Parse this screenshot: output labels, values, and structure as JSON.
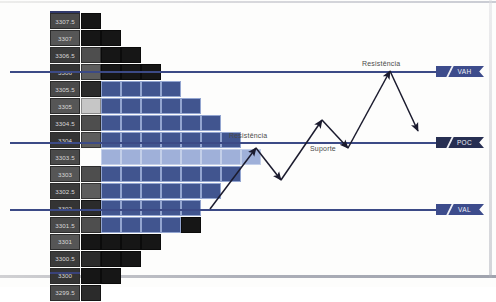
{
  "chart_data": {
    "type": "bar",
    "orientation": "horizontal",
    "title": "",
    "xlabel": "",
    "ylabel": "Preço",
    "grid": false,
    "legend": "right-tags",
    "categories": [
      "3307.5",
      "3307",
      "3306.5",
      "3306",
      "3305.5",
      "3305",
      "3304.5",
      "3304",
      "3303.5",
      "3303",
      "3302.5",
      "3302",
      "3301.5",
      "3301",
      "3300.5",
      "3300",
      "3299.5"
    ],
    "values": [
      1,
      2,
      3,
      4,
      5,
      6,
      7,
      8,
      9,
      8,
      7,
      6,
      5,
      4,
      3,
      2,
      1
    ],
    "rows": [
      {
        "price": "3307.5",
        "count": 1,
        "cells": [
          "c-black"
        ]
      },
      {
        "price": "3307",
        "count": 2,
        "cells": [
          "c-black",
          "c-black"
        ]
      },
      {
        "price": "3306.5",
        "count": 3,
        "cells": [
          "c-gray",
          "c-black",
          "c-black"
        ]
      },
      {
        "price": "3306",
        "count": 4,
        "cells": [
          "c-mgray",
          "c-black",
          "c-black",
          "c-black"
        ]
      },
      {
        "price": "3305.5",
        "count": 5,
        "cells": [
          "c-dkgray",
          "c-blue",
          "c-blue",
          "c-blue",
          "c-blue"
        ]
      },
      {
        "price": "3305",
        "count": 6,
        "cells": [
          "c-xlgray",
          "c-blue",
          "c-blue",
          "c-blue",
          "c-blue",
          "c-blue"
        ]
      },
      {
        "price": "3304.5",
        "count": 7,
        "cells": [
          "c-gray",
          "c-blue",
          "c-blue",
          "c-blue",
          "c-blue",
          "c-blue",
          "c-blue"
        ]
      },
      {
        "price": "3304",
        "count": 8,
        "cells": [
          "c-mgray",
          "c-blue",
          "c-blue",
          "c-blue",
          "c-blue",
          "c-blue",
          "c-blue",
          "c-blue"
        ]
      },
      {
        "price": "3303.5",
        "count": 9,
        "cells": [
          "c-blank",
          "c-lblue",
          "c-lblue",
          "c-lblue",
          "c-lblue",
          "c-lblue",
          "c-lblue",
          "c-lblue",
          "c-lblue"
        ]
      },
      {
        "price": "3303",
        "count": 8,
        "cells": [
          "c-gray",
          "c-blue",
          "c-blue",
          "c-blue",
          "c-blue",
          "c-blue",
          "c-blue",
          "c-blue"
        ]
      },
      {
        "price": "3302.5",
        "count": 7,
        "cells": [
          "c-mgray",
          "c-blue",
          "c-blue",
          "c-blue",
          "c-blue",
          "c-blue",
          "c-blue"
        ]
      },
      {
        "price": "3302",
        "count": 6,
        "cells": [
          "c-dkgray",
          "c-blue",
          "c-blue",
          "c-blue",
          "c-blue",
          "c-blue"
        ]
      },
      {
        "price": "3301.5",
        "count": 6,
        "cells": [
          "c-gray",
          "c-blue",
          "c-blue",
          "c-blue",
          "c-blue",
          "c-black"
        ]
      },
      {
        "price": "3301",
        "count": 4,
        "cells": [
          "c-black",
          "c-black",
          "c-black",
          "c-black"
        ]
      },
      {
        "price": "3300.5",
        "count": 3,
        "cells": [
          "c-dkgray",
          "c-black",
          "c-black"
        ]
      },
      {
        "price": "3300",
        "count": 2,
        "cells": [
          "c-black",
          "c-black"
        ]
      },
      {
        "price": "3299.5",
        "count": 1,
        "cells": [
          "c-dkgray"
        ]
      }
    ],
    "levels": [
      {
        "key": "vah",
        "label": "VAH",
        "price": "3306",
        "y": 71
      },
      {
        "key": "poc",
        "label": "POC",
        "price": "3303.5",
        "y": 142
      },
      {
        "key": "val",
        "label": "VAL",
        "price": "3301.5",
        "y": 209
      }
    ],
    "annotations": [
      {
        "key": "resistencia-low",
        "text": "Resistência"
      },
      {
        "key": "resistencia-high",
        "text": "Resistência"
      },
      {
        "key": "suporte",
        "text": "Suporte"
      }
    ],
    "colors": {
      "level_line": "#3c4a86",
      "tag_vah": "#3d4c8c",
      "tag_poc": "#272f52",
      "tag_val": "#3d4c8c",
      "bar_blue": "#41558f",
      "bar_poc_blue": "#9fb0d9",
      "bar_black": "#161616",
      "axis_label_bg": "#4a4a4a",
      "arrow": "#1b1b2e",
      "page_bg": "#fdfdfc"
    }
  }
}
